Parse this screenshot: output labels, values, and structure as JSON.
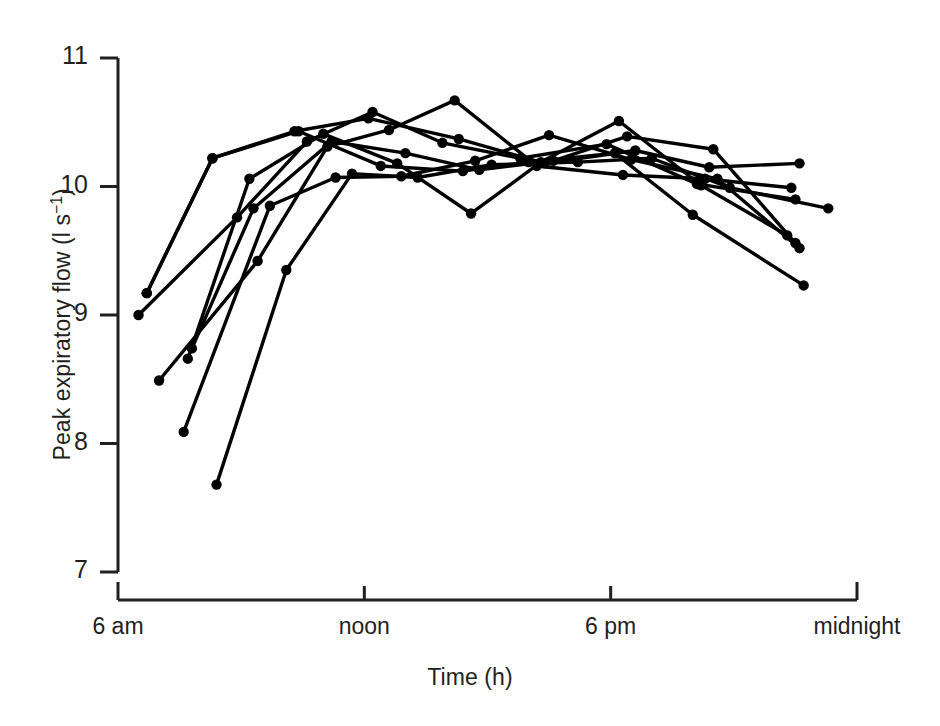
{
  "figure": {
    "background_color": "#ffffff",
    "ink_color": "#000000"
  },
  "chart_data": {
    "type": "line",
    "title": "",
    "subtitle": "",
    "xlabel": "Time (h)",
    "ylabel_plain": "Peak expiratory flow (l s-1)",
    "ylabel_main": "Peak expiratory flow (l s",
    "ylabel_exponent": "−1",
    "ylabel_close": ")",
    "xlim": [
      6,
      24
    ],
    "ylim": [
      7,
      11
    ],
    "grid": false,
    "legend": false,
    "legend_position": "none",
    "marker": "filled-circle",
    "yticks": [
      7,
      8,
      9,
      10,
      11
    ],
    "ytick_labels": [
      "7",
      "8",
      "9",
      "10",
      "11"
    ],
    "xticks": [
      6,
      12,
      18,
      24
    ],
    "xtick_labels": [
      "6 am",
      "noon",
      "6 pm",
      "midnight"
    ],
    "series": [
      {
        "name": "subject-1",
        "x": [
          6.7,
          8.3,
          10.3,
          12.1,
          14.3,
          16.4,
          18.6,
          20.4,
          22.6
        ],
        "values": [
          9.17,
          10.22,
          10.43,
          10.53,
          10.37,
          10.18,
          10.28,
          10.15,
          10.18
        ]
      },
      {
        "name": "subject-2",
        "x": [
          6.5,
          8.9,
          10.6,
          12.2,
          13.9,
          15.8,
          17.9,
          20.1,
          22.5
        ],
        "values": [
          9.0,
          9.76,
          10.35,
          10.58,
          10.34,
          10.22,
          10.33,
          10.02,
          9.9
        ]
      },
      {
        "name": "subject-3",
        "x": [
          7.0,
          9.4,
          11.1,
          12.6,
          14.2,
          16.2,
          18.3,
          20.3,
          22.4
        ],
        "values": [
          8.49,
          9.42,
          10.31,
          10.44,
          10.67,
          10.16,
          10.09,
          10.06,
          9.99
        ]
      },
      {
        "name": "subject-4",
        "x": [
          7.7,
          9.2,
          11.0,
          12.8,
          14.6,
          16.3,
          18.2,
          20.2,
          22.3
        ],
        "values": [
          8.66,
          10.06,
          10.41,
          10.18,
          9.79,
          10.19,
          10.51,
          10.01,
          9.62
        ]
      },
      {
        "name": "subject-5",
        "x": [
          7.8,
          9.3,
          11.2,
          13.0,
          14.8,
          16.6,
          18.4,
          20.5,
          22.5
        ],
        "values": [
          8.74,
          9.83,
          10.35,
          10.26,
          10.13,
          10.2,
          10.39,
          10.29,
          9.56
        ]
      },
      {
        "name": "subject-6",
        "x": [
          7.6,
          9.7,
          11.3,
          12.9,
          14.7,
          16.5,
          18.5,
          20.6,
          22.6
        ],
        "values": [
          8.09,
          9.85,
          10.07,
          10.08,
          10.2,
          10.4,
          10.21,
          10.06,
          9.52
        ]
      },
      {
        "name": "subject-7",
        "x": [
          8.4,
          10.1,
          11.7,
          13.3,
          15.1,
          17.2,
          19.0,
          20.9,
          23.3
        ],
        "values": [
          7.68,
          9.35,
          10.1,
          10.07,
          10.17,
          10.19,
          10.22,
          9.99,
          9.83
        ]
      },
      {
        "name": "subject-8",
        "x": [
          6.7,
          8.3,
          10.4,
          12.4,
          14.4,
          16.0,
          18.1,
          20.0,
          22.7
        ],
        "values": [
          9.17,
          10.22,
          10.43,
          10.16,
          10.12,
          10.19,
          10.26,
          9.78,
          9.23
        ]
      }
    ]
  }
}
